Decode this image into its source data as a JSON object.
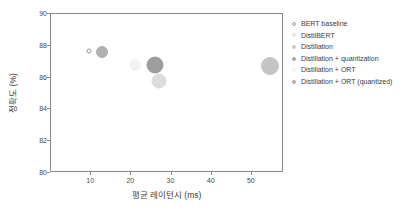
{
  "chart_data": {
    "type": "scatter",
    "title": "",
    "xlabel": "평균 레이턴시 (ms)",
    "ylabel": "정확도 (%)",
    "xlim": [
      0,
      58
    ],
    "ylim": [
      80,
      90
    ],
    "grid": false,
    "legend_position": "right",
    "xticks": [
      "10",
      "20",
      "30",
      "40",
      "50"
    ],
    "xtick_values": [
      10,
      20,
      30,
      40,
      50
    ],
    "yticks": [
      "80",
      "82",
      "84",
      "86",
      "88",
      "90"
    ],
    "ytick_values": [
      80,
      82,
      84,
      86,
      88,
      90
    ],
    "series": [
      {
        "name": "BERT baseline",
        "x": 9.5,
        "y": 87.7,
        "size": 5,
        "color": "#ffffff",
        "edge_color": "#9a9a9a",
        "filled": false
      },
      {
        "name": "DistilBERT",
        "x": 12.6,
        "y": 87.6,
        "size": 12,
        "color": "#b0b0b0",
        "edge_color": "#b0b0b0",
        "filled": true
      },
      {
        "name": "Distillation",
        "x": 21.0,
        "y": 86.8,
        "size": 12,
        "color": "#f2f2f2",
        "edge_color": "#f2f2f2",
        "filled": true
      },
      {
        "name": "Distillation + quantization",
        "x": 26.0,
        "y": 86.8,
        "size": 17,
        "color": "#9e9e9e",
        "edge_color": "#9e9e9e",
        "filled": true
      },
      {
        "name": "Distillation + ORT",
        "x": 27.0,
        "y": 85.8,
        "size": 15,
        "color": "#dcdcdc",
        "edge_color": "#dcdcdc",
        "filled": true
      },
      {
        "name": "Distillation + ORT (quantized)",
        "x": 54.5,
        "y": 86.7,
        "size": 18,
        "color": "#c4c4c4",
        "edge_color": "#c4c4c4",
        "filled": true
      }
    ]
  },
  "legend": {
    "items": [
      {
        "label": "BERT baseline",
        "color": "#ffffff",
        "edge": "#9a9a9a",
        "dot": 4
      },
      {
        "label": "DistilBERT",
        "color": "#e6e6e6",
        "edge": "#e6e6e6",
        "dot": 4
      },
      {
        "label": "Distillation",
        "color": "#c9c9c9",
        "edge": "#c9c9c9",
        "dot": 4
      },
      {
        "label": "Distillation + quantization",
        "color": "#a8a8a8",
        "edge": "#a8a8a8",
        "dot": 4
      },
      {
        "label": "Distillation + ORT",
        "color": "#f4f4f4",
        "edge": "#f4f4f4",
        "dot": 4
      },
      {
        "label": "Distillation + ORT (quantized)",
        "color": "#d6d6d6",
        "edge": "#9a9a9a",
        "dot": 4
      }
    ]
  },
  "axes": {
    "frame_color": "#8a8a8a",
    "tick_color": "#4a4a4a"
  }
}
